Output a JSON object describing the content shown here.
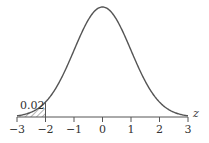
{
  "chart_data": {
    "type": "area",
    "title": "",
    "xlabel": "z",
    "ylabel": "",
    "xlim": [
      -3,
      3
    ],
    "x_ticks": [
      -3,
      -2,
      -1,
      0,
      1,
      2,
      3
    ],
    "x_tick_labels": [
      "−3",
      "−2",
      "−1",
      "0",
      "1",
      "2",
      "3"
    ],
    "grid": false,
    "legend": null,
    "curve": {
      "name": "standard normal density",
      "mean": 0,
      "sd": 1
    },
    "shaded_region": {
      "from": -3,
      "to": -2,
      "pattern": "hatched",
      "label": "0.02"
    },
    "annotations": [
      {
        "text": "0.02",
        "x": -2.6,
        "position": "above shaded tail"
      }
    ]
  },
  "labels": {
    "axis_var": "z",
    "tail_area": "0.02",
    "ticks": [
      "−3",
      "−2",
      "−1",
      "0",
      "1",
      "2",
      "3"
    ]
  },
  "colors": {
    "curve": "#555555",
    "axis": "#555555",
    "hatch": "#666666",
    "text": "#333333"
  }
}
